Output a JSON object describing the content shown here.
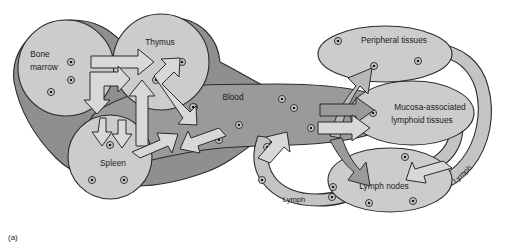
{
  "figure": {
    "panel_label": "(a)",
    "background_color": "#ffffff",
    "organ_fill": "#cccccc",
    "blood_fill": "#9a9a9a",
    "blood_dark_fill": "#8f8f8f",
    "lymph_fill": "#c4c4c4",
    "arrow_fill": "#d8d8d8",
    "outline_color": "#2b2b2b",
    "cell_ring_color": "#3a3a3a",
    "cell_core_color": "#1a1a1a"
  },
  "organs": [
    {
      "id": "bone-marrow",
      "label": "Bone\nmarrow",
      "label_line1": "Bone",
      "label_line2": "marrow",
      "cell_count": 3
    },
    {
      "id": "thymus",
      "label": "Thymus",
      "cell_count": 3
    },
    {
      "id": "spleen",
      "label": "Spleen",
      "cell_count": 3
    },
    {
      "id": "blood",
      "label": "Blood",
      "cell_count": 9
    },
    {
      "id": "peripheral-tissues",
      "label": "Peripheral tissues",
      "cell_count": 3
    },
    {
      "id": "mucosa-associated-lymphoid-tissues",
      "label": "Mucosa-associated\nlymphoid tissues",
      "label_line1": "Mucosa-associated",
      "label_line2": "lymphoid tissues",
      "cell_count": 1
    },
    {
      "id": "lymph-nodes",
      "label": "Lymph nodes",
      "cell_count": 5
    }
  ],
  "vessels": [
    {
      "id": "lymph-lower-left",
      "label": "Lymph"
    },
    {
      "id": "lymph-right",
      "label": "Lymph"
    }
  ]
}
